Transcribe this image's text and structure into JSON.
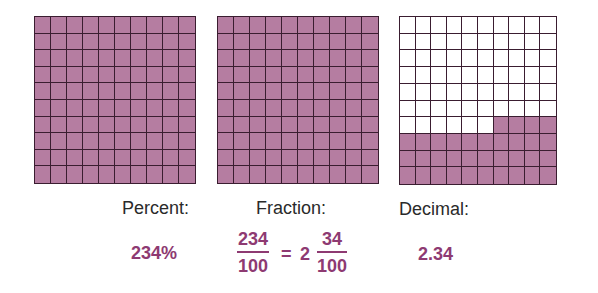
{
  "grids": [
    {
      "name": "percent-grid",
      "shaded_cells": 100,
      "x": 34,
      "y": 16,
      "w": 162,
      "h": 168
    },
    {
      "name": "fraction-grid",
      "shaded_cells": 100,
      "x": 217,
      "y": 16,
      "w": 162,
      "h": 168
    },
    {
      "name": "decimal-grid",
      "shaded_cells": 34,
      "x": 399,
      "y": 16,
      "w": 158,
      "h": 169
    }
  ],
  "colors": {
    "fill": "#b57da1",
    "line": "#3a1d30",
    "accent_text": "#8e3a72"
  },
  "labels": {
    "percent": "Percent:",
    "fraction": "Fraction:",
    "decimal": "Decimal:"
  },
  "values": {
    "percent": "234%",
    "fraction_num": "234",
    "fraction_den": "100",
    "equals": "=",
    "mixed_whole": "2",
    "mixed_num": "34",
    "mixed_den": "100",
    "decimal": "2.34"
  }
}
